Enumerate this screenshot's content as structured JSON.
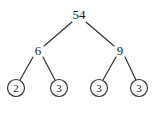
{
  "figure": {
    "type": "factor-tree-diagram",
    "background_color": "#ffffff",
    "ink_color": "#2b2b2b"
  },
  "chart_data": {
    "type": "diagram",
    "title": "",
    "nodes": [
      {
        "id": "root",
        "label": "54",
        "x": 79,
        "y": 15,
        "circled": false
      },
      {
        "id": "left",
        "label": "6",
        "x": 38,
        "y": 51,
        "circled": false
      },
      {
        "id": "right",
        "label": "9",
        "x": 120,
        "y": 51,
        "circled": false
      },
      {
        "id": "leaf1",
        "label": "2",
        "x": 16,
        "y": 88,
        "circled": true
      },
      {
        "id": "leaf2",
        "label": "3",
        "x": 59,
        "y": 88,
        "circled": true
      },
      {
        "id": "leaf3",
        "label": "3",
        "x": 99,
        "y": 88,
        "circled": true
      },
      {
        "id": "leaf4",
        "label": "3",
        "x": 139,
        "y": 88,
        "circled": true
      }
    ],
    "edges": [
      {
        "from": "root",
        "to": "left",
        "x1": 72,
        "y1": 22,
        "x2": 44,
        "y2": 46
      },
      {
        "from": "root",
        "to": "right",
        "x1": 86,
        "y1": 22,
        "x2": 114,
        "y2": 46
      },
      {
        "from": "left",
        "to": "leaf1",
        "x1": 33,
        "y1": 57,
        "x2": 20,
        "y2": 80
      },
      {
        "from": "left",
        "to": "leaf2",
        "x1": 43,
        "y1": 57,
        "x2": 55,
        "y2": 80
      },
      {
        "from": "right",
        "to": "leaf3",
        "x1": 116,
        "y1": 57,
        "x2": 103,
        "y2": 80
      },
      {
        "from": "right",
        "to": "leaf4",
        "x1": 125,
        "y1": 57,
        "x2": 136,
        "y2": 80
      }
    ],
    "leaf_radius": 8.5
  }
}
